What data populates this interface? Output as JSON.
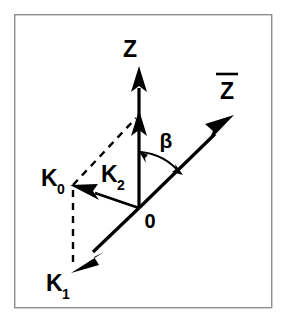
{
  "figure": {
    "background_color": "#ffffff",
    "stroke_color": "#000000",
    "frame_color": "#8d8d8d"
  },
  "labels": {
    "z_axis": "Z",
    "z_bar_axis": "Z",
    "z_bar_overline": "¯",
    "origin": "0",
    "beta": "β",
    "k0_base": "K",
    "k0_sub": "0",
    "k1_base": "K",
    "k1_sub": "1",
    "k2_base": "K",
    "k2_sub": "2"
  },
  "vectors": [
    {
      "name": "Z",
      "label": "Z",
      "from": [
        139,
        208
      ],
      "to": [
        139,
        68
      ],
      "style": "solid",
      "arrow": "end"
    },
    {
      "name": "Zbar",
      "label": "Z̄",
      "from": [
        139,
        208
      ],
      "to": [
        233,
        116
      ],
      "style": "solid",
      "arrow": "end"
    },
    {
      "name": "K2",
      "label": "K2",
      "from": [
        139,
        208
      ],
      "to": [
        139,
        112
      ],
      "style": "solid",
      "arrow": "end"
    },
    {
      "name": "K0",
      "label": "K0",
      "from": [
        139,
        208
      ],
      "to": [
        72,
        185
      ],
      "style": "solid",
      "arrow": "end"
    },
    {
      "name": "K1",
      "label": "K1",
      "from": [
        139,
        208
      ],
      "to": [
        73,
        272
      ],
      "style": "solid",
      "arrow": "end"
    }
  ],
  "construction_lines": [
    {
      "name": "k0-to-k2-tip",
      "from": [
        73,
        184
      ],
      "to": [
        136,
        117
      ],
      "style": "dashed"
    },
    {
      "name": "k0-to-k1",
      "from": [
        73,
        188
      ],
      "to": [
        73,
        266
      ],
      "style": "dashed"
    }
  ],
  "angle": {
    "name": "beta",
    "symbol": "β",
    "between": [
      "Z",
      "Zbar"
    ],
    "vertex": [
      139,
      208
    ],
    "arrow": "both"
  },
  "frame": {
    "x": 14,
    "y": 14,
    "width": 258,
    "height": 294
  }
}
